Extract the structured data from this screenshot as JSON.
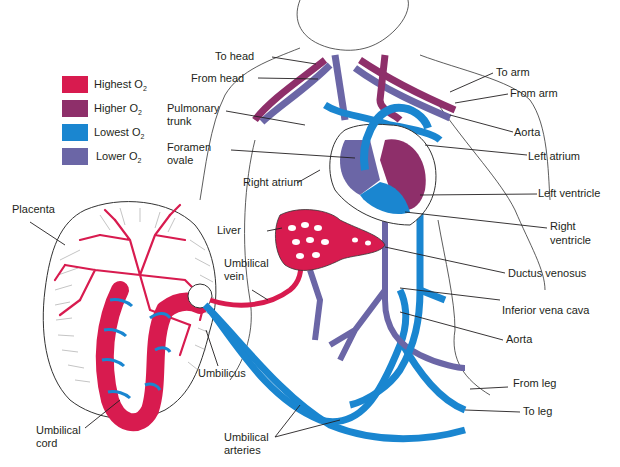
{
  "figure": {
    "colors": {
      "highest": "#d81b4f",
      "higher": "#8e2f6a",
      "lowest": "#1a86d0",
      "lower": "#6b66a6",
      "outline": "#333333",
      "text": "#231f20"
    }
  },
  "legend": {
    "items": [
      {
        "label": "Highest O",
        "sub": "2",
        "color": "#d81b4f"
      },
      {
        "label": "Higher O",
        "sub": "2",
        "color": "#8e2f6a"
      },
      {
        "label": "Lowest O",
        "sub": "2",
        "color": "#1a86d0"
      },
      {
        "label": "Lower O",
        "sub": "2",
        "color": "#6b66a6"
      }
    ]
  },
  "labels": {
    "left": {
      "to_head": "To head",
      "from_head": "From head",
      "pulmonary_trunk_1": "Pulmonary",
      "pulmonary_trunk_2": "trunk",
      "foramen_ovale_1": "Foramen",
      "foramen_ovale_2": "ovale",
      "right_atrium": "Right atrium",
      "liver": "Liver",
      "placenta": "Placenta",
      "umbilical_vein_1": "Umbilical",
      "umbilical_vein_2": "vein",
      "umbilicus": "Umbilicus",
      "umbilical_cord_1": "Umbilical",
      "umbilical_cord_2": "cord",
      "umbilical_arteries_1": "Umbilical",
      "umbilical_arteries_2": "arteries"
    },
    "right": {
      "to_arm": "To arm",
      "from_arm": "From arm",
      "aorta_top": "Aorta",
      "left_atrium": "Left atrium",
      "left_ventricle": "Left ventricle",
      "right_ventricle_1": "Right",
      "right_ventricle_2": "ventricle",
      "ductus_venosus": "Ductus venosus",
      "inferior_vena_cava": "Inferior vena cava",
      "aorta_bottom": "Aorta",
      "from_leg": "From leg",
      "to_leg": "To leg"
    }
  }
}
